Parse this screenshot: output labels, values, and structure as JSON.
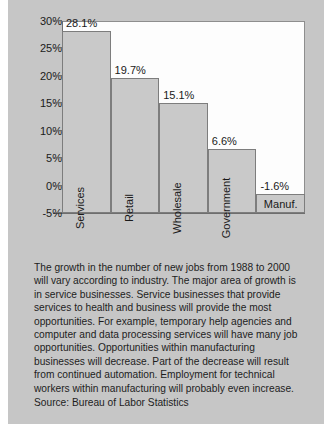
{
  "chart_data": {
    "type": "bar",
    "title": "",
    "xlabel": "",
    "ylabel": "",
    "ylim": [
      -5,
      30
    ],
    "grid": false,
    "legend": "none",
    "categories": [
      "Services",
      "Retail",
      "Wholesale",
      "Government",
      "Manuf."
    ],
    "values": [
      28.1,
      19.7,
      15.1,
      6.6,
      -1.6
    ],
    "value_labels": [
      "28.1%",
      "19.7%",
      "15.1%",
      "6.6%",
      "-1.6%"
    ],
    "ytick_labels": [
      "30%",
      "25%",
      "20%",
      "15%",
      "10%",
      "5%",
      "0%",
      "-5%"
    ],
    "ytick_values": [
      30,
      25,
      20,
      15,
      10,
      5,
      0,
      -5
    ],
    "bar_fill": "#c9c9c9",
    "bar_stroke": "#7d7d7d",
    "plot_background": "#fdfdfd",
    "page_background": "#c6c6c6"
  },
  "body": {
    "paragraph": "The growth in the number of new jobs from 1988 to 2000 will vary according to industry. The major area of growth is in service businesses. Service businesses that provide services to health and business will provide the most opportunities. For example, temporary help agencies and computer and data processing services will have many job opportunities. Opportunities within manufacturing businesses will decrease. Part of the decrease will result from continued automation. Employment for technical workers within manufacturing will probably even increase.",
    "source": "Source: Bureau of Labor Statistics"
  }
}
